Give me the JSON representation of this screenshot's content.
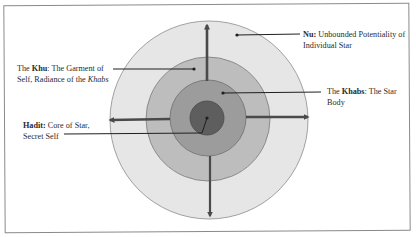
{
  "diagram": {
    "type": "concentric-circles",
    "center": {
      "x": 208,
      "y": 118
    },
    "rings": [
      {
        "name": "nu",
        "radius": 99,
        "fill": "#e6e6e6",
        "stroke": "#8c8c8c"
      },
      {
        "name": "khu",
        "radius": 62,
        "fill": "#bdbdbd",
        "stroke": "#7a7a7a"
      },
      {
        "name": "khabs",
        "radius": 38,
        "fill": "#9c9c9c",
        "stroke": "#6e6e6e"
      },
      {
        "name": "hadit",
        "radius": 17,
        "fill": "#5e5e5e",
        "stroke": "#4a4a4a"
      }
    ],
    "arrow_color": "#4a4a4a",
    "leader_color": "#1f1f1f"
  },
  "labels": {
    "nu": {
      "term": "Nu:",
      "line1_rest": " Unbounded Potentiality of",
      "line2": "Individual Star"
    },
    "khu": {
      "prefix": "The ",
      "term": "Khu",
      "line1_rest": ": The Garment of",
      "line2_prefix": "Self, Radiance of the ",
      "line2_italic": "Khabs"
    },
    "khabs": {
      "prefix": "The ",
      "term": "Khabs",
      "line1_rest": ": The Star",
      "line2": "Body"
    },
    "hadit": {
      "term": "Hadit:",
      "line1_rest": " Core of Star,",
      "line2": "Secret Self"
    }
  }
}
